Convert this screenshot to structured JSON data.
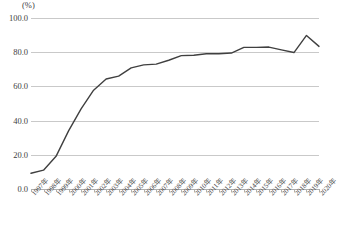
{
  "chart_data": {
    "type": "line",
    "title": "",
    "subtitle": "",
    "xlabel": "",
    "ylabel": "",
    "unit_label": "(%)",
    "ylim": [
      0.0,
      100.0
    ],
    "yticks": [
      "0.0",
      "20.0",
      "40.0",
      "60.0",
      "80.0",
      "100.0"
    ],
    "ytick_values": [
      0.0,
      20.0,
      40.0,
      60.0,
      80.0,
      100.0
    ],
    "grid": true,
    "legend": false,
    "legend_position": "none",
    "line_color": "#404040",
    "categories": [
      "1997年",
      "1998年",
      "1999年",
      "2000年",
      "2001年",
      "2002年",
      "2003年",
      "2004年",
      "2005年",
      "2006年",
      "2007年",
      "2008年",
      "2009年",
      "2010年",
      "2011年",
      "2012年",
      "2013年",
      "2014年",
      "2015年",
      "2016年",
      "2017年",
      "2018年",
      "2019年",
      "2020年"
    ],
    "series": [
      {
        "name": "",
        "values": [
          9.2,
          11.0,
          19.1,
          34.0,
          46.9,
          57.8,
          64.3,
          66.0,
          70.8,
          72.6,
          73.0,
          75.3,
          78.0,
          78.2,
          79.1,
          79.1,
          79.5,
          82.8,
          82.8,
          83.0,
          81.4,
          79.8,
          89.8,
          83.4
        ]
      }
    ]
  }
}
